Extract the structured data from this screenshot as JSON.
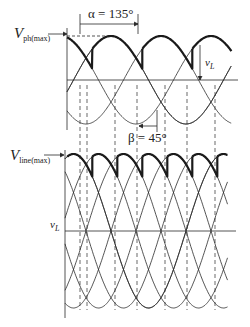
{
  "figure": {
    "top_plot": {
      "vmax_label": "V",
      "vmax_sub": "ph(max)",
      "alpha_label": "α = 135°",
      "beta_label": "β = 45°",
      "beta_sup": "",
      "vl_label": "v",
      "vl_sub": "L"
    },
    "bottom_plot": {
      "vmax_label": "V",
      "vmax_sub": "line(max)",
      "vl_label": "v",
      "vl_sub": "L"
    },
    "colors": {
      "line": "#2a2a2a",
      "background": "#ffffff"
    }
  },
  "geometry": {
    "top": {
      "x0": 67,
      "x1": 238,
      "axis_y": 80,
      "amp": 44,
      "deg_px": 0.4167,
      "phase0_x": 73.5,
      "alpha_deg": 135
    },
    "bottom": {
      "x0": 65,
      "x1": 236,
      "axis_y": 231,
      "amp": 77,
      "deg_px": 0.4167,
      "phase0_x": 73.5,
      "alpha_deg": 135
    }
  }
}
